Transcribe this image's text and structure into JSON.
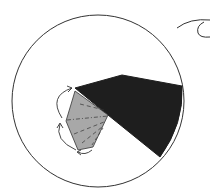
{
  "diagram": {
    "type": "origami-fold-diagram",
    "colors": {
      "background": "#ffffff",
      "outline": "#333333",
      "dark_flap": "#1e1e1e",
      "gray_flap": "#a8a8a8"
    },
    "elements": [
      {
        "name": "paper-circle",
        "shape": "circle"
      },
      {
        "name": "dark-folded-wedge",
        "shape": "polygon"
      },
      {
        "name": "gray-flap",
        "shape": "polygon",
        "fold_lines": "dashed valley + dash-dot mountain"
      },
      {
        "name": "curved-arrows",
        "count": 3
      },
      {
        "name": "rotate-view-symbol",
        "shape": "arc"
      }
    ]
  }
}
